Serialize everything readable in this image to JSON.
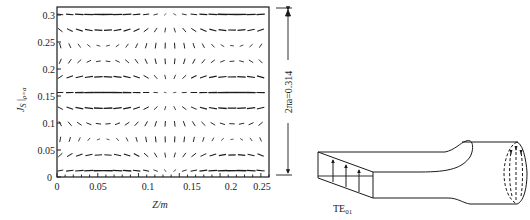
{
  "figure": {
    "left_panel": {
      "title": "",
      "xlabel": "Z/m",
      "ylabel_main": "J",
      "ylabel_sub": "S",
      "ylabel_eval": "ρ=a",
      "dimension_label": "2πa=0.314",
      "x_ticks": [
        "0",
        "0.05",
        "0.1",
        "0.15",
        "0.2",
        "0.25"
      ],
      "y_ticks": [
        "0",
        "0.05",
        "0.1",
        "0.15",
        "0.2",
        "0.25",
        "0.3"
      ]
    },
    "right_panel": {
      "mode_label_main": "TE",
      "mode_label_sub": "01"
    }
  },
  "chart_data": {
    "type": "vector_field",
    "xlabel": "Z/m",
    "ylabel": "J_S|ρ=a",
    "xlim": [
      0,
      0.26
    ],
    "ylim": [
      0,
      0.32
    ],
    "x_ticks": [
      0,
      0.05,
      0.1,
      0.15,
      0.2,
      0.25
    ],
    "y_ticks": [
      0,
      0.05,
      0.1,
      0.15,
      0.2,
      0.25,
      0.3
    ],
    "annotations": [
      "2πa=0.314"
    ],
    "grid": false
  },
  "colors": {
    "ink": "#1a1a1a",
    "background": "#ffffff"
  }
}
